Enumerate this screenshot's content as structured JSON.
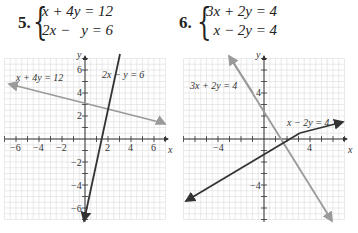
{
  "problems": [
    {
      "number": "5.",
      "equations": [
        "x + 4y = 12",
        "2x −   y = 6"
      ]
    },
    {
      "number": "6.",
      "equations": [
        "3x + 2y = 4",
        "  x − 2y = 4"
      ]
    }
  ],
  "chart_data": [
    {
      "type": "line",
      "title": "5. x + 4y = 12, 2x − y = 6",
      "xlabel": "x",
      "ylabel": "y",
      "xlim": [
        -7,
        7
      ],
      "ylim": [
        -7,
        7
      ],
      "grid": true,
      "x_ticks": [
        -6,
        -4,
        -2,
        2,
        4,
        6
      ],
      "y_ticks": [
        -6,
        -4,
        -2,
        2,
        4,
        6
      ],
      "series": [
        {
          "name": "x + 4y = 12",
          "color": "#9a9a9a",
          "points": [
            [
              -6.8,
              4.7
            ],
            [
              6.8,
              1.3
            ]
          ]
        },
        {
          "name": "2x − y = 6",
          "color": "#333333",
          "points": [
            [
              -0.1,
              -7
            ],
            [
              6.2,
              6.6
            ]
          ]
        }
      ],
      "intersection": [
        4,
        2
      ],
      "annotations": [
        "x + 4y = 12",
        "2x − y = 6"
      ]
    },
    {
      "type": "line",
      "title": "6. 3x + 2y = 4, x − 2y = 4",
      "xlabel": "x",
      "ylabel": "y",
      "xlim": [
        -7,
        7
      ],
      "ylim": [
        -7,
        7
      ],
      "grid": true,
      "x_ticks": [
        -4,
        4
      ],
      "y_ticks": [
        -4,
        4
      ],
      "series": [
        {
          "name": "3x + 2y = 4",
          "color": "#9a9a9a",
          "points": [
            [
              -3,
              6.5
            ],
            [
              6,
              -7
            ]
          ]
        },
        {
          "name": "x − 2y = 4",
          "color": "#333333",
          "points": [
            [
              -6.8,
              -5.4
            ],
            [
              6.8,
              1.4
            ]
          ]
        }
      ],
      "intersection": [
        2,
        -1
      ],
      "annotations": [
        "3x + 2y = 4",
        "x − 2y = 4"
      ]
    }
  ],
  "graph5": {
    "axis_x_label": "x",
    "axis_y_label": "y",
    "tick_labels_x": [
      "−6",
      "−4",
      "−2",
      "2",
      "4",
      "6"
    ],
    "tick_labels_y": [
      "6",
      "4",
      "2",
      "−2",
      "−4",
      "−6"
    ],
    "line1_label": "x + 4y = 12",
    "line2_label": "2x − y = 6"
  },
  "graph6": {
    "axis_x_label": "x",
    "axis_y_label": "y",
    "tick_labels_x": [
      "−4",
      "4"
    ],
    "tick_labels_y": [
      "4",
      "−4"
    ],
    "line1_label": "3x + 2y = 4",
    "line2_label": "x − 2y = 4"
  }
}
